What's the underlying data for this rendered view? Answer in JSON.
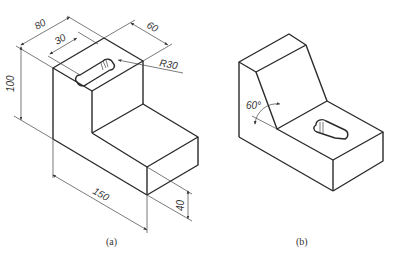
{
  "figure_a": {
    "caption": "(a)",
    "dimensions": {
      "width_top": "80",
      "slot_offset": "30",
      "depth": "60",
      "radius": "R30",
      "height": "100",
      "length": "150",
      "base_height": "40"
    }
  },
  "figure_b": {
    "caption": "(b)",
    "angle": "60°"
  },
  "colors": {
    "line": "#2a2a2a",
    "background": "#ffffff"
  }
}
